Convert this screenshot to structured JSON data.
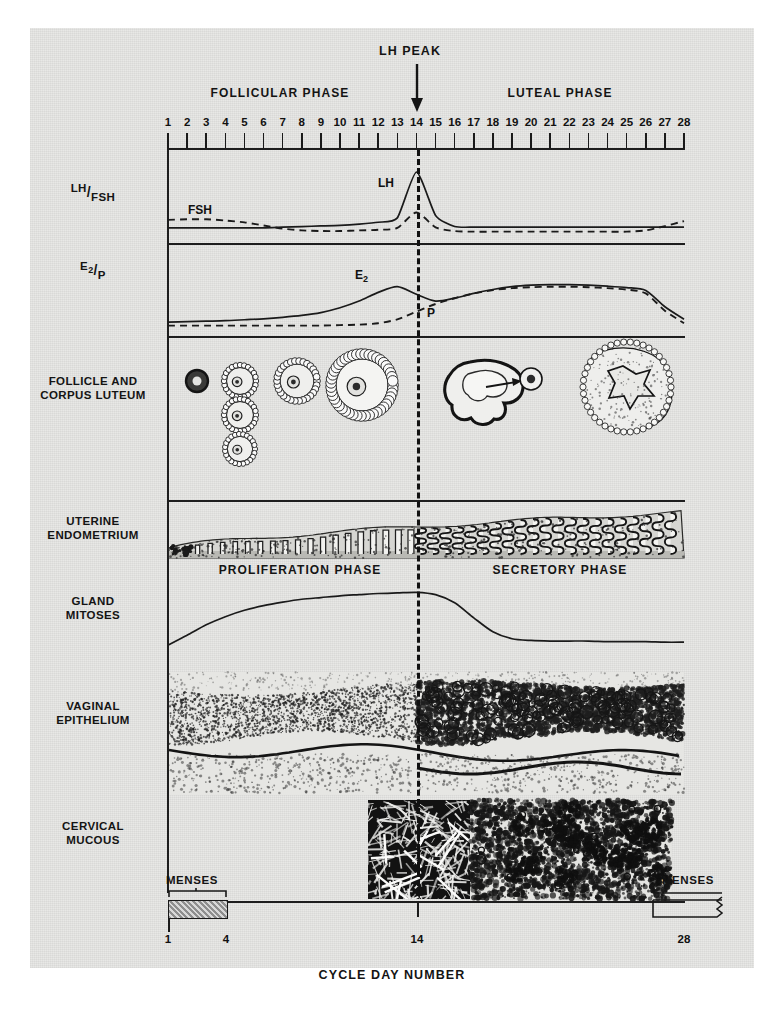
{
  "figure": {
    "top_annotation": "LH PEAK",
    "axis_title": "CYCLE DAY NUMBER",
    "phase_left": "FOLLICULAR PHASE",
    "phase_right": "LUTEAL PHASE",
    "endometrium_phase_left": "PROLIFERATION PHASE",
    "endometrium_phase_right": "SECRETORY PHASE",
    "menses_left_label": "MENSES",
    "menses_right_label": "MENSES",
    "menses_left_start_day": "1",
    "menses_left_end_day": "4",
    "menses_mid_day": "14",
    "menses_right_end_day": "28",
    "ovulation_day": 14
  },
  "row_labels": [
    {
      "id": "lh-fsh",
      "line1": "LH",
      "line2": "FSH",
      "fraction": true
    },
    {
      "id": "e2-p",
      "line1": "E2",
      "line2": "P",
      "fraction": true
    },
    {
      "id": "follicle",
      "line1": "FOLLICLE AND",
      "line2": "CORPUS LUTEUM",
      "fraction": false
    },
    {
      "id": "endometrium",
      "line1": "UTERINE",
      "line2": "ENDOMETRIUM",
      "fraction": false
    },
    {
      "id": "mitoses",
      "line1": "GLAND",
      "line2": "MITOSES",
      "fraction": false
    },
    {
      "id": "vaginal",
      "line1": "VAGINAL",
      "line2": "EPITHELIUM",
      "fraction": false
    },
    {
      "id": "cervical",
      "line1": "CERVICAL",
      "line2": "MUCOUS",
      "fraction": false
    }
  ],
  "curve_labels": {
    "lh": "LH",
    "fsh": "FSH",
    "e2": "E",
    "e2_sub": "2",
    "p": "P"
  },
  "axis_days": [
    "1",
    "2",
    "3",
    "4",
    "5",
    "6",
    "7",
    "8",
    "9",
    "10",
    "11",
    "12",
    "13",
    "14",
    "15",
    "16",
    "17",
    "18",
    "19",
    "20",
    "21",
    "22",
    "23",
    "24",
    "25",
    "26",
    "27",
    "28"
  ],
  "colors": {
    "ink": "#141414",
    "paper": "#e8e8e6",
    "menses_fill": "#8e8e8e",
    "dark_mucous": "#141414"
  },
  "chart_data": {
    "type": "line",
    "xlabel": "CYCLE DAY NUMBER",
    "ylabel": "",
    "x": [
      1,
      2,
      3,
      4,
      5,
      6,
      7,
      8,
      9,
      10,
      11,
      12,
      13,
      14,
      15,
      16,
      17,
      18,
      19,
      20,
      21,
      22,
      23,
      24,
      25,
      26,
      27,
      28
    ],
    "xlim": [
      1,
      28
    ],
    "grid": false,
    "legend": "inline-labels",
    "annotations": [
      {
        "text": "LH PEAK",
        "day": 14,
        "type": "arrow-down"
      },
      {
        "text": "FOLLICULAR PHASE",
        "day_range": [
          1,
          14
        ]
      },
      {
        "text": "LUTEAL PHASE",
        "day_range": [
          14,
          28
        ]
      },
      {
        "text": "PROLIFERATION PHASE",
        "day_range": [
          1,
          14
        ]
      },
      {
        "text": "SECRETORY PHASE",
        "day_range": [
          14,
          28
        ]
      },
      {
        "text": "MENSES",
        "day_range": [
          1,
          4
        ]
      },
      {
        "text": "MENSES",
        "day_range": [
          27,
          28
        ]
      }
    ],
    "panels": [
      {
        "name": "LH/FSH",
        "series": [
          {
            "name": "LH",
            "style": "solid",
            "values": [
              10,
              10,
              10,
              10,
              10,
              10,
              11,
              12,
              13,
              14,
              16,
              19,
              26,
              100,
              30,
              12,
              11,
              11,
              11,
              11,
              11,
              11,
              11,
              11,
              11,
              11,
              11,
              11
            ]
          },
          {
            "name": "FSH",
            "style": "dashed",
            "values": [
              26,
              27,
              27,
              25,
              22,
              17,
              12,
              9,
              8,
              8,
              9,
              10,
              13,
              38,
              14,
              8,
              7,
              7,
              7,
              7,
              7,
              7,
              7,
              7,
              7,
              9,
              16,
              24
            ]
          }
        ]
      },
      {
        "name": "E2/P",
        "series": [
          {
            "name": "E2",
            "style": "solid",
            "values": [
              8,
              9,
              10,
              11,
              13,
              15,
              18,
              22,
              28,
              38,
              52,
              70,
              82,
              66,
              52,
              58,
              68,
              76,
              82,
              85,
              86,
              86,
              85,
              83,
              80,
              74,
              40,
              14
            ]
          },
          {
            "name": "P",
            "style": "dashed",
            "values": [
              5,
              5,
              5,
              5,
              5,
              5,
              5,
              5,
              5,
              6,
              7,
              10,
              18,
              34,
              50,
              62,
              72,
              79,
              83,
              85,
              86,
              86,
              85,
              83,
              80,
              72,
              36,
              10
            ]
          }
        ]
      },
      {
        "name": "GLAND MITOSES",
        "series": [
          {
            "name": "Gland mitoses",
            "style": "solid",
            "values": [
              5,
              22,
              40,
              54,
              65,
              73,
              79,
              84,
              87,
              90,
              92,
              94,
              95,
              96,
              92,
              78,
              52,
              28,
              16,
              13,
              12,
              12,
              12,
              11,
              11,
              11,
              10,
              10
            ]
          }
        ]
      }
    ],
    "image_panels": [
      {
        "name": "FOLLICLE AND CORPUS LUTEUM",
        "stages": [
          "primordial follicle",
          "primary follicles",
          "secondary follicle",
          "antral/graafian follicle",
          "ovulation with ovum release",
          "corpus luteum"
        ]
      },
      {
        "name": "UTERINE ENDOMETRIUM",
        "stages": [
          "thin proliferative glands",
          "tall straight glands",
          "tortuous secretory glands"
        ]
      },
      {
        "name": "VAGINAL EPITHELIUM",
        "stages": [
          "basophilic small cells",
          "cornified superficial cells"
        ]
      },
      {
        "name": "CERVICAL MUCOUS",
        "stages": [
          "dense ferning at ovulation",
          "granular cellular mucous in luteal phase"
        ]
      }
    ]
  }
}
